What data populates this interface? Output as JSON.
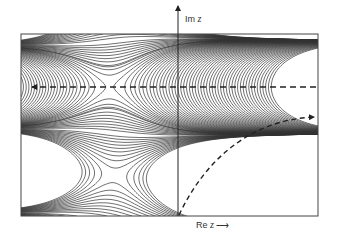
{
  "figure": {
    "title": "",
    "axes": {
      "imag_label_prefix": "Im",
      "imag_label_var": "z",
      "real_label_prefix": "Re",
      "real_label_var": "z",
      "real_arrow": "⟶"
    },
    "paths": [
      {
        "name": "horizontal-dashed-path",
        "style": "dashed",
        "direction": "right-to-left",
        "through_saddle": true
      },
      {
        "name": "curved-dashed-path",
        "style": "dashed",
        "direction": "origin-to-upper-right"
      }
    ],
    "features": [
      "saddle-point",
      "contour-lines"
    ],
    "colors": {
      "lines": "#333333",
      "background": "#ffffff"
    }
  }
}
